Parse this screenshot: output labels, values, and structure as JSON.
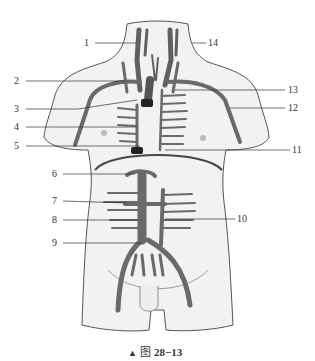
{
  "figure": {
    "caption_marker": "▲",
    "caption_prefix": "图",
    "caption_number": "28−13",
    "colors": {
      "skin": "#f2f2f2",
      "outline": "#555555",
      "vessel": "#707070",
      "vessel_dark": "#3c3c3c",
      "leader": "#333333"
    }
  },
  "labels": [
    {
      "id": "1",
      "text": "1"
    },
    {
      "id": "2",
      "text": "2"
    },
    {
      "id": "3",
      "text": "3"
    },
    {
      "id": "4",
      "text": "4"
    },
    {
      "id": "5",
      "text": "5"
    },
    {
      "id": "6",
      "text": "6"
    },
    {
      "id": "7",
      "text": "7"
    },
    {
      "id": "8",
      "text": "8"
    },
    {
      "id": "9",
      "text": "9"
    },
    {
      "id": "10",
      "text": "10"
    },
    {
      "id": "11",
      "text": "11"
    },
    {
      "id": "12",
      "text": "12"
    },
    {
      "id": "13",
      "text": "13"
    },
    {
      "id": "14",
      "text": "14"
    }
  ]
}
